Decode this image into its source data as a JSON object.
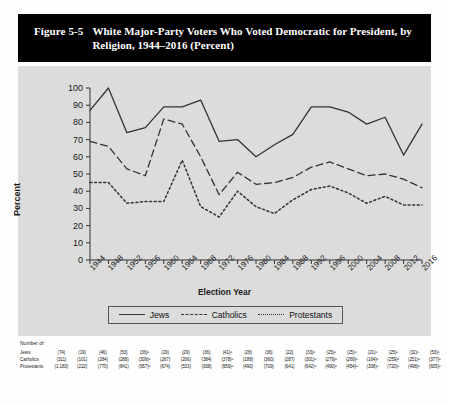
{
  "figure": {
    "number": "Figure 5-5",
    "title": "White Major-Party Voters Who Voted Democratic for President, by Religion, 1944–2016 (Percent)"
  },
  "legend": {
    "position": "bottom",
    "items": [
      {
        "label": "Jews",
        "style": "solid"
      },
      {
        "label": "Catholics",
        "style": "dashed"
      },
      {
        "label": "Protestants",
        "style": "dotted"
      }
    ]
  },
  "notes": {
    "header": "Number of:",
    "rows": [
      {
        "label": "Jews",
        "values": [
          "(74)",
          "(19)",
          "(46)",
          "(53)",
          "(36)ᵃ",
          "(29)",
          "(29)",
          "(36)",
          "(41)ᵃ",
          "(28)",
          "(36)",
          "(22)",
          "(33)ᵃ",
          "(25)ᵃ",
          "(25)ᵃ",
          "(21)ᵃ",
          "(25)ᵃ",
          "(32)ᵃ",
          "(53)ᵃ"
        ]
      },
      {
        "label": "Catholics",
        "values": [
          "(311)",
          "(101)",
          "(284)",
          "(288)",
          "(309)ᵃ",
          "(267)",
          "(206)",
          "(384)",
          "(378)ᵃ",
          "(188)",
          "(360)",
          "(287)",
          "(301)ᵃ",
          "(279)ᵃ",
          "(269)ᵃ",
          "(164)ᵃ",
          "(259)ᵃ",
          "(251)ᵃ",
          "(377)ᵃ"
        ]
      },
      {
        "label": "Protestants",
        "values": [
          "(1,183)",
          "(222)",
          "(770)",
          "(841)",
          "(957)ᵃ",
          "(674)",
          "(533)",
          "(938)",
          "(959)ᵃ",
          "(490)",
          "(709)",
          "(641)",
          "(642)ᵃ",
          "(490)ᵃ",
          "(454)ᵃ",
          "(308)ᵃ",
          "(720)ᵃ",
          "(498)ᵃ",
          "(605)ᵃ"
        ]
      }
    ]
  },
  "chart_data": {
    "type": "line",
    "title": "White Major-Party Voters Who Voted Democratic for President, by Religion, 1944–2016 (Percent)",
    "xlabel": "Election Year",
    "ylabel": "Percent",
    "ylim": [
      0,
      100
    ],
    "ytick_step": 10,
    "yticks": [
      0,
      10,
      20,
      30,
      40,
      50,
      60,
      70,
      80,
      90,
      100
    ],
    "grid": false,
    "legend_position": "bottom",
    "categories": [
      "1944",
      "1948",
      "1952",
      "1956",
      "1960",
      "1964",
      "1968",
      "1972",
      "1976",
      "1980",
      "1984",
      "1988",
      "1992",
      "1996",
      "2000",
      "2004",
      "2008",
      "2012",
      "2016"
    ],
    "series": [
      {
        "name": "Jews",
        "style": "solid",
        "values": [
          87,
          100,
          74,
          77,
          89,
          89,
          93,
          69,
          70,
          60,
          67,
          73,
          89,
          89,
          86,
          79,
          83,
          61,
          79
        ]
      },
      {
        "name": "Catholics",
        "style": "dashed",
        "values": [
          69,
          66,
          53,
          49,
          82,
          79,
          60,
          38,
          51,
          44,
          45,
          48,
          54,
          57,
          53,
          49,
          50,
          47,
          42
        ]
      },
      {
        "name": "Protestants",
        "style": "dotted",
        "values": [
          45,
          45,
          33,
          34,
          34,
          58,
          31,
          25,
          40,
          31,
          27,
          35,
          41,
          43,
          39,
          33,
          37,
          32,
          32
        ]
      }
    ]
  },
  "colors": {
    "title_bar_bg": "#000000",
    "title_text": "#ffffff",
    "panel_bg": "#dcdcdc",
    "line": "#333333",
    "page_bg": "#fefefe"
  }
}
